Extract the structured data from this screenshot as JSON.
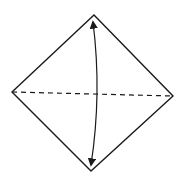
{
  "diagram": {
    "type": "origami-fold-step",
    "colors": {
      "background": "#ffffff",
      "stroke": "#1a1a1a"
    },
    "shape": {
      "name": "diamond",
      "vertices": {
        "top": [
          94,
          15
        ],
        "right": [
          173,
          96
        ],
        "bottom": [
          91,
          171
        ],
        "left": [
          12,
          92
        ]
      }
    },
    "fold_line": {
      "style": "dashed",
      "from": [
        12,
        92
      ],
      "to": [
        173,
        96
      ],
      "dash": [
        5,
        4
      ]
    },
    "arrow": {
      "style": "curved-double-headed",
      "from": [
        93,
        22
      ],
      "to": [
        91,
        165
      ],
      "bulge_x": 97
    }
  }
}
